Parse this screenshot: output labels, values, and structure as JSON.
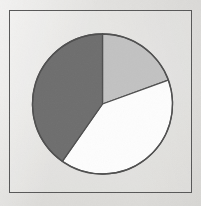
{
  "figure": {
    "width": 201,
    "height": 206,
    "background_color": "#e3e2df",
    "frame": {
      "name": "chart-border-frame",
      "x": 9,
      "y": 10,
      "width": 183,
      "height": 183,
      "stroke_color": "#575757",
      "stroke_width": 1.5
    }
  },
  "chart_data": {
    "type": "pie",
    "title": "",
    "subtitle": "",
    "xlabel": "",
    "ylabel": "",
    "grid": false,
    "legend": false,
    "legend_position": "none",
    "labels": [
      "Slice 1",
      "Slice 2",
      "Slice 3"
    ],
    "values": [
      19,
      40,
      41
    ],
    "percentages": [
      "19%",
      "40%",
      "41%"
    ],
    "angles_deg": [
      70,
      145,
      145
    ],
    "start_angle_deg": 90,
    "direction": "clockwise",
    "colors": [
      "#c2c2c2",
      "#fdfdfd",
      "#6e6e6e"
    ],
    "slice_stroke_color": "#4f4f4f",
    "slice_stroke_width": 1.3,
    "center": {
      "x": 102.5,
      "y": 104
    },
    "radius": 70,
    "slices": [
      {
        "name": "slice-light-gray",
        "label": "Slice 1",
        "value": 19,
        "percent": "19%",
        "angle_deg": 70,
        "start_deg": 0,
        "end_deg": 70,
        "color": "#c2c2c2"
      },
      {
        "name": "slice-white",
        "label": "Slice 2",
        "value": 40,
        "percent": "40%",
        "angle_deg": 145,
        "start_deg": 70,
        "end_deg": 215,
        "color": "#fdfdfd"
      },
      {
        "name": "slice-dark-gray",
        "label": "Slice 3",
        "value": 41,
        "percent": "41%",
        "angle_deg": 145,
        "start_deg": 215,
        "end_deg": 360,
        "color": "#6e6e6e"
      }
    ]
  },
  "accessibility": {
    "figure_description": "Pie chart with three slices: light gray, white and dark gray"
  }
}
